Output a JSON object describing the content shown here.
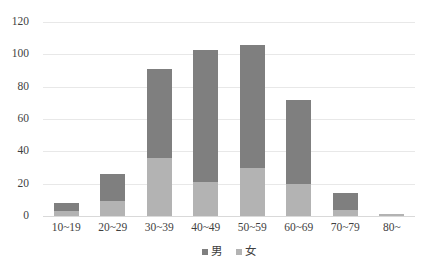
{
  "chart_data": {
    "type": "bar",
    "stacked": true,
    "title": "",
    "xlabel": "",
    "ylabel": "",
    "ylim": [
      0,
      120
    ],
    "ytick_step": 20,
    "yticks": [
      "0",
      "20",
      "40",
      "60",
      "80",
      "100",
      "120"
    ],
    "grid": true,
    "legend_position": "bottom-center",
    "categories": [
      "10~19",
      "20~29",
      "30~39",
      "40~49",
      "50~59",
      "60~69",
      "70~79",
      "80~"
    ],
    "series": [
      {
        "name": "女",
        "color": "#b3b3b3",
        "values": [
          3,
          9,
          36,
          21,
          30,
          20,
          4,
          1
        ]
      },
      {
        "name": "男",
        "color": "#7f7f7f",
        "values": [
          5,
          17,
          55,
          82,
          76,
          52,
          10,
          0
        ]
      }
    ],
    "totals": [
      8,
      26,
      91,
      103,
      106,
      72,
      14,
      1
    ],
    "legend": [
      "男",
      "女"
    ]
  },
  "colors": {
    "male": "#7f7f7f",
    "female": "#b3b3b3",
    "gridline": "#e8e8e8",
    "axis": "#d9d9d9",
    "text": "#3f3f3f",
    "background": "#ffffff"
  }
}
